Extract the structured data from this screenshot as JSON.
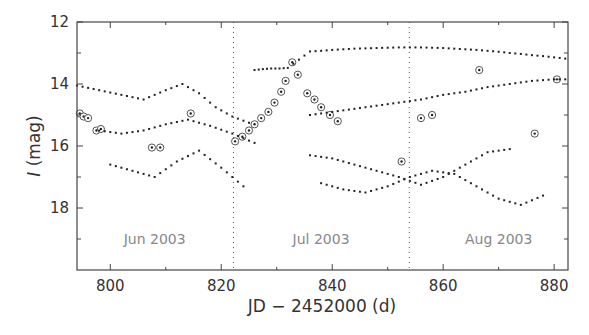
{
  "chart_data": {
    "type": "scatter",
    "title": "",
    "xlabel": "JD − 2452000 (d)",
    "ylabel_italic": "I",
    "ylabel_rest": " (mag)",
    "xlim": [
      794,
      882.5
    ],
    "ylim": [
      20,
      12
    ],
    "y_inverted": true,
    "grid": false,
    "x_ticks": [
      800,
      820,
      840,
      860,
      880
    ],
    "x_minor_ticks": [
      810,
      830,
      850,
      870
    ],
    "y_ticks": [
      12,
      14,
      16,
      18
    ],
    "y_minor_ticks": [
      13,
      15,
      17,
      19
    ],
    "vertical_markers": [
      822.2,
      853.9
    ],
    "month_labels": [
      {
        "text": "Jun 2003",
        "x": 808,
        "y": 19.0
      },
      {
        "text": "Jul 2003",
        "x": 838,
        "y": 19.0
      },
      {
        "text": "Aug 2003",
        "x": 870,
        "y": 19.0
      }
    ],
    "series": [
      {
        "name": "microlensing event (circled)",
        "marker": "circle-dot",
        "x": [
          794.5,
          795.2,
          796,
          797.5,
          798.3,
          807.5,
          809,
          814.5,
          822.5,
          823.8,
          825,
          826,
          827.2,
          828.5,
          829.6,
          830.8,
          831.6,
          832.8,
          833.8,
          835.5,
          836.8,
          838,
          839.6,
          841,
          852.5,
          856,
          858,
          866.5,
          876.5,
          880.5
        ],
        "y": [
          14.95,
          15.05,
          15.1,
          15.5,
          15.45,
          16.05,
          16.05,
          14.95,
          15.85,
          15.7,
          15.5,
          15.3,
          15.1,
          14.9,
          14.6,
          14.25,
          13.9,
          13.3,
          13.7,
          14.3,
          14.5,
          14.75,
          15.0,
          15.2,
          16.5,
          15.1,
          15.0,
          13.55,
          15.6,
          13.85
        ]
      },
      {
        "name": "bright flat star",
        "marker": "dot",
        "x": [
          826,
          827.5,
          829,
          830.5,
          832,
          836,
          838,
          840,
          842,
          844,
          846,
          848,
          850,
          852,
          854,
          856,
          858,
          860,
          862,
          864,
          866,
          868,
          870,
          872,
          874,
          876,
          878,
          880,
          882
        ],
        "y": [
          13.55,
          13.52,
          13.5,
          13.5,
          13.48,
          12.95,
          12.93,
          12.9,
          12.88,
          12.86,
          12.85,
          12.84,
          12.83,
          12.82,
          12.82,
          12.82,
          12.83,
          12.84,
          12.86,
          12.88,
          12.9,
          12.93,
          12.96,
          13.0,
          13.03,
          13.07,
          13.1,
          13.14,
          13.18
        ]
      },
      {
        "name": "rising star",
        "marker": "dot",
        "x": [
          836,
          840,
          844,
          848,
          852,
          856,
          860,
          864,
          868,
          872,
          876,
          880,
          882
        ],
        "y": [
          15.0,
          14.9,
          14.8,
          14.7,
          14.6,
          14.5,
          14.35,
          14.25,
          14.1,
          14.0,
          13.9,
          13.85,
          13.85
        ]
      },
      {
        "name": "variable 1",
        "marker": "dot",
        "x": [
          794,
          798,
          802,
          806,
          810,
          813,
          816,
          819,
          822,
          825
        ],
        "y": [
          14.05,
          14.2,
          14.35,
          14.5,
          14.2,
          14.0,
          14.3,
          14.75,
          15.05,
          15.25
        ]
      },
      {
        "name": "variable 2",
        "marker": "dot",
        "x": [
          798,
          802,
          806,
          810,
          814,
          818,
          822,
          826
        ],
        "y": [
          15.5,
          15.6,
          15.5,
          15.3,
          15.15,
          15.35,
          15.6,
          15.9
        ]
      },
      {
        "name": "variable 3",
        "marker": "dot",
        "x": [
          800,
          804,
          808,
          812,
          816,
          820,
          824
        ],
        "y": [
          16.6,
          16.8,
          17.0,
          16.5,
          16.15,
          16.7,
          17.3
        ]
      },
      {
        "name": "variable 4",
        "marker": "dot",
        "x": [
          836,
          840,
          844,
          848,
          852,
          856,
          860,
          864,
          868,
          872
        ],
        "y": [
          16.3,
          16.4,
          16.6,
          16.8,
          17.0,
          17.25,
          17.0,
          16.6,
          16.2,
          16.1
        ]
      },
      {
        "name": "variable 5",
        "marker": "dot",
        "x": [
          838,
          842,
          846,
          850,
          854,
          858,
          862,
          866,
          870,
          874,
          878
        ],
        "y": [
          17.2,
          17.4,
          17.5,
          17.3,
          17.0,
          16.8,
          16.9,
          17.3,
          17.7,
          17.9,
          17.6
        ]
      }
    ]
  }
}
